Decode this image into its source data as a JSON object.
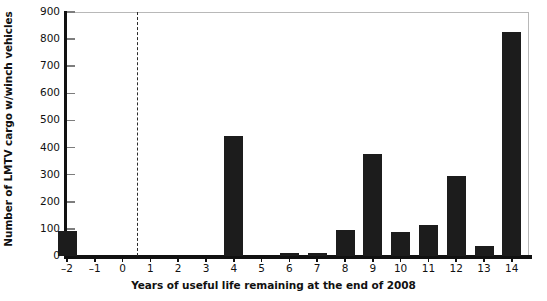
{
  "chart_data": {
    "type": "bar",
    "title": "",
    "xlabel": "Years of useful life remaining at the end of 2008",
    "ylabel": "Number of LMTV cargo w/winch vehicles",
    "categories": [
      "-2",
      "-1",
      "0",
      "1",
      "2",
      "3",
      "4",
      "5",
      "6",
      "7",
      "8",
      "9",
      "10",
      "11",
      "12",
      "13",
      "14"
    ],
    "values": [
      92,
      0,
      0,
      0,
      0,
      0,
      443,
      0,
      10,
      12,
      97,
      375,
      88,
      115,
      295,
      38,
      825
    ],
    "xlim": [
      -2.6,
      14.7
    ],
    "ylim": [
      0,
      900
    ],
    "ytick_labels": [
      "0",
      "100",
      "200",
      "300",
      "400",
      "500",
      "600",
      "700",
      "800",
      "900"
    ],
    "ytick_values": [
      0,
      100,
      200,
      300,
      400,
      500,
      600,
      700,
      800,
      900
    ],
    "xtick_labels": [
      "-2",
      "-1",
      "0",
      "1",
      "2",
      "3",
      "4",
      "5",
      "6",
      "7",
      "8",
      "9",
      "10",
      "11",
      "12",
      "13",
      "14"
    ],
    "grid": false,
    "legend": null,
    "bar_color": "#1c1c1c",
    "annotations": [
      {
        "name": "zero-life-divider",
        "type": "vertical-dashed-line",
        "x": 0.5,
        "color": "#2b2b2b"
      }
    ]
  }
}
